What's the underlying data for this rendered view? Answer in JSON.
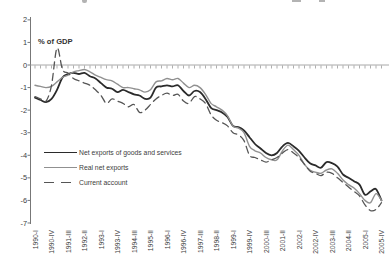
{
  "chart_data": {
    "type": "line",
    "unit_label": "% of GDP",
    "grid": "zero-line-only",
    "legend_position": "inside-left",
    "x_axis": {
      "tick_label_every": 3,
      "categories": [
        "1990-I",
        "1990-II",
        "1990-III",
        "1990-IV",
        "1991-I",
        "1991-II",
        "1991-III",
        "1991-IV",
        "1992-I",
        "1992-II",
        "1992-III",
        "1992-IV",
        "1993-I",
        "1993-II",
        "1993-III",
        "1993-IV",
        "1994-I",
        "1994-II",
        "1994-III",
        "1994-IV",
        "1995-I",
        "1995-II",
        "1995-III",
        "1995-IV",
        "1996-I",
        "1996-II",
        "1996-III",
        "1996-IV",
        "1997-I",
        "1997-II",
        "1997-III",
        "1997-IV",
        "1998-I",
        "1998-II",
        "1998-III",
        "1998-IV",
        "1999-I",
        "1999-II",
        "1999-III",
        "1999-IV",
        "2000-I",
        "2000-II",
        "2000-III",
        "2000-IV",
        "2001-I",
        "2001-II",
        "2001-III",
        "2001-IV",
        "2002-I",
        "2002-II",
        "2002-III",
        "2002-IV",
        "2003-I",
        "2003-II",
        "2003-III",
        "2003-IV",
        "2004-I",
        "2004-II",
        "2004-III",
        "2004-IV",
        "2005-I",
        "2005-II",
        "2005-III",
        "2005-IV"
      ],
      "shown_tick_labels": [
        "1990-I",
        "1990-IV",
        "1991-III",
        "1992-II",
        "1993-I",
        "1993-IV",
        "1994-III",
        "1995-II",
        "1996-I",
        "1996-IV",
        "1997-III",
        "1998-II",
        "1999-I",
        "1999-IV",
        "2000-III",
        "2001-II",
        "2002-I",
        "2002-IV",
        "2003-III",
        "2004-II",
        "2005-I",
        "2005-IV"
      ]
    },
    "y_axis": {
      "min": -7,
      "max": 2,
      "ticks": [
        2,
        1,
        0,
        -1,
        -2,
        -3,
        -4,
        -5,
        -6,
        -7
      ]
    },
    "series": [
      {
        "name": "Net exports of goods and services",
        "style": "solid",
        "color": "#2b2b2b",
        "width": 1.8,
        "values": [
          -1.45,
          -1.55,
          -1.65,
          -1.5,
          -1.1,
          -0.55,
          -0.4,
          -0.35,
          -0.4,
          -0.35,
          -0.5,
          -0.6,
          -0.8,
          -1.0,
          -1.05,
          -1.2,
          -1.1,
          -1.2,
          -1.3,
          -1.35,
          -1.5,
          -1.45,
          -1.0,
          -0.95,
          -0.9,
          -0.95,
          -0.9,
          -1.15,
          -1.35,
          -1.15,
          -1.2,
          -1.5,
          -1.9,
          -2.0,
          -2.1,
          -2.3,
          -2.7,
          -2.75,
          -2.9,
          -3.2,
          -3.5,
          -3.7,
          -3.9,
          -4.0,
          -3.9,
          -3.6,
          -3.45,
          -3.6,
          -3.8,
          -4.1,
          -4.35,
          -4.45,
          -4.55,
          -4.3,
          -4.35,
          -4.5,
          -4.85,
          -5.0,
          -5.15,
          -5.3,
          -5.75,
          -5.6,
          -5.5,
          -6.0
        ]
      },
      {
        "name": "Real net exports",
        "style": "solid",
        "color": "#909090",
        "width": 1.4,
        "values": [
          -0.9,
          -0.95,
          -1.0,
          -0.95,
          -0.75,
          -0.55,
          -0.45,
          -0.3,
          -0.25,
          -0.2,
          -0.3,
          -0.45,
          -0.55,
          -0.65,
          -0.7,
          -0.85,
          -1.0,
          -1.0,
          -1.05,
          -1.1,
          -1.2,
          -1.1,
          -0.75,
          -0.7,
          -0.6,
          -0.65,
          -0.6,
          -0.8,
          -1.0,
          -0.9,
          -1.0,
          -1.3,
          -1.7,
          -1.85,
          -2.0,
          -2.25,
          -2.7,
          -2.8,
          -3.0,
          -3.6,
          -3.8,
          -3.9,
          -4.1,
          -4.2,
          -4.2,
          -3.8,
          -3.55,
          -3.75,
          -4.0,
          -4.4,
          -4.65,
          -4.75,
          -4.8,
          -4.65,
          -4.6,
          -4.8,
          -5.1,
          -5.3,
          -5.45,
          -5.7,
          -6.0,
          -6.1,
          -5.7,
          -6.0
        ]
      },
      {
        "name": "Current account",
        "style": "dashed",
        "color": "#555555",
        "width": 1.3,
        "values": [
          -1.4,
          -1.5,
          -1.6,
          -0.9,
          0.75,
          -0.2,
          -0.35,
          -0.6,
          -0.7,
          -0.8,
          -0.9,
          -1.1,
          -1.35,
          -1.7,
          -1.5,
          -1.6,
          -1.7,
          -1.85,
          -1.75,
          -2.1,
          -2.0,
          -1.75,
          -1.5,
          -1.35,
          -1.25,
          -1.35,
          -1.3,
          -1.6,
          -1.7,
          -1.4,
          -1.5,
          -1.7,
          -2.2,
          -2.45,
          -2.55,
          -2.7,
          -3.0,
          -3.1,
          -3.35,
          -4.0,
          -4.1,
          -4.2,
          -4.3,
          -4.2,
          -4.1,
          -3.9,
          -3.75,
          -3.9,
          -4.1,
          -4.4,
          -4.7,
          -4.8,
          -4.9,
          -4.75,
          -4.8,
          -5.0,
          -5.2,
          -5.4,
          -5.6,
          -5.8,
          -6.2,
          -6.45,
          -6.4,
          -6.1
        ]
      }
    ]
  }
}
